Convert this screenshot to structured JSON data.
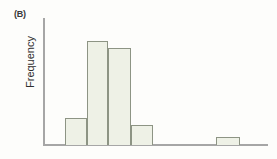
{
  "figure": {
    "panel_label": "(B)",
    "background_color": "#fdfdfb"
  },
  "axes": {
    "y_title": "Frequency",
    "x_title": "",
    "axis_color": "#a6a6a6",
    "y_tick_labels": [],
    "x_tick_labels": []
  },
  "style": {
    "bar_fill": "#eef1e6",
    "bar_border": "#8d9484"
  },
  "chart_data": {
    "type": "bar",
    "title": "(B)",
    "subtitle": "",
    "xlabel": "",
    "ylabel": "Frequency",
    "categories": [
      "1",
      "2",
      "3",
      "4",
      "5",
      "6",
      "7",
      "8",
      "9"
    ],
    "values": [
      27,
      104,
      97,
      20,
      0,
      0,
      0,
      8,
      0
    ],
    "bar_geometry": [
      {
        "index": 0,
        "x_left": 65,
        "x_right": 87,
        "height": 27
      },
      {
        "index": 1,
        "x_left": 87,
        "x_right": 108,
        "height": 104
      },
      {
        "index": 2,
        "x_left": 108,
        "x_right": 131,
        "height": 97
      },
      {
        "index": 3,
        "x_left": 131,
        "x_right": 153,
        "height": 20
      },
      {
        "index": 4,
        "x_left": 216,
        "x_right": 240,
        "height": 8
      }
    ],
    "ylim": [
      0,
      128
    ],
    "grid": false,
    "legend": null,
    "legend_position": "none",
    "tick_labels_shown": false,
    "note": "Right-skewed histogram of frequency; tall cluster at left, one isolated low bar far right (outlier group)."
  }
}
